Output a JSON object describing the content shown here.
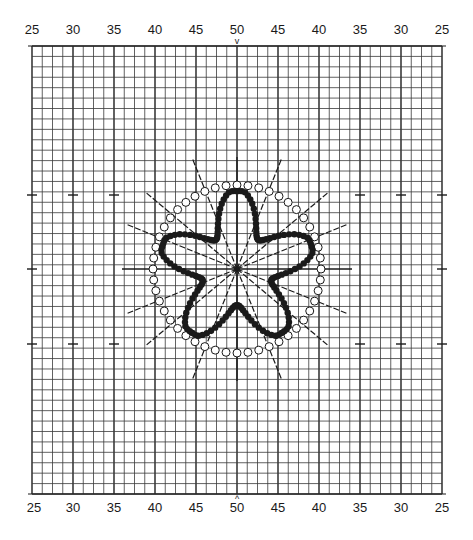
{
  "chart_data": {
    "type": "diagram",
    "title": "",
    "top_axis_labels": [
      "25",
      "30",
      "35",
      "40",
      "45",
      "50",
      "45",
      "40",
      "35",
      "30",
      "25"
    ],
    "bottom_axis_labels": [
      "25",
      "30",
      "35",
      "40",
      "45",
      "50",
      "45",
      "40",
      "35",
      "30",
      "25"
    ],
    "center_marker_top": "v",
    "center_marker_bottom": "^",
    "grid": {
      "columns": 41,
      "rows": 43,
      "major_every": 4
    },
    "center": {
      "x": 237,
      "y": 269
    },
    "outer_ring": {
      "symbol": "open-circle",
      "radius_px": 84,
      "count": 48
    },
    "inner_star": {
      "symbol": "filled-dot",
      "lobes": 5
    },
    "radial_lines": 12,
    "colors": {
      "ink": "#1a1a1a",
      "grid": "#3a3a3a",
      "paper": "#ffffff"
    }
  }
}
